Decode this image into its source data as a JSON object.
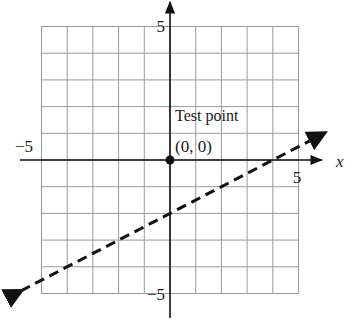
{
  "chart_data": {
    "type": "line",
    "title": "",
    "xlabel": "x",
    "ylabel": "",
    "xlim": [
      -5,
      5
    ],
    "ylim": [
      -5,
      5
    ],
    "grid": true,
    "x_ticks_labeled": [
      -5,
      5
    ],
    "y_ticks_labeled": [
      5,
      -5
    ],
    "tick_labels": {
      "x_neg": "−5",
      "x_pos": "5",
      "y_pos": "5",
      "y_neg": "−5"
    },
    "series": [
      {
        "name": "boundary line",
        "style": "dashed",
        "equation": "y = x/2 - 2",
        "x": [
          -5.8,
          6
        ],
        "y": [
          -4.9,
          1
        ],
        "arrows_both_ends": true
      }
    ],
    "points": [
      {
        "label": "Test point",
        "coord_label": "(0, 0)",
        "x": 0,
        "y": 0
      }
    ],
    "annotations": {
      "test_point_title": "Test point",
      "test_point_coords": "(0, 0)"
    }
  },
  "colors": {
    "grid": "#9a9a9a",
    "axis": "#111111",
    "line": "#111111"
  }
}
